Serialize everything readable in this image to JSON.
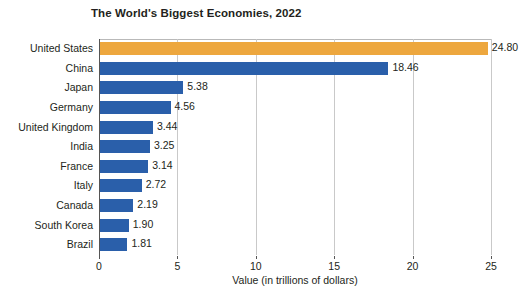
{
  "chart_data": {
    "type": "bar",
    "orientation": "horizontal",
    "title": "The World's Biggest Economies, 2022",
    "xlabel": "Value (in trillions of dollars)",
    "ylabel": "",
    "xlim": [
      0,
      25
    ],
    "xticks": [
      "0",
      "5",
      "10",
      "15",
      "20",
      "25"
    ],
    "grid": "vertical",
    "legend": "none",
    "categories": [
      "United States",
      "China",
      "Japan",
      "Germany",
      "United Kingdom",
      "India",
      "France",
      "Italy",
      "Canada",
      "South Korea",
      "Brazil"
    ],
    "values": [
      24.8,
      18.46,
      5.38,
      4.56,
      3.44,
      3.25,
      3.14,
      2.72,
      2.19,
      1.9,
      1.81
    ],
    "value_labels": [
      "24.80",
      "18.46",
      "5.38",
      "4.56",
      "3.44",
      "3.25",
      "3.14",
      "2.72",
      "2.19",
      "1.90",
      "1.81"
    ],
    "bar_colors": [
      "#eda73e",
      "#2a5faa",
      "#2a5faa",
      "#2a5faa",
      "#2a5faa",
      "#2a5faa",
      "#2a5faa",
      "#2a5faa",
      "#2a5faa",
      "#2a5faa",
      "#2a5faa"
    ],
    "highlight_color": "#eda73e",
    "series_color": "#2a5faa",
    "grid_color": "#c9c9c9",
    "axis_color": "#555555",
    "background_color": "#ffffff"
  }
}
